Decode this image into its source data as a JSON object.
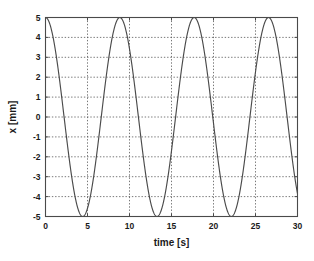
{
  "chart_data": {
    "type": "line",
    "title": "",
    "xlabel": "time [s]",
    "ylabel": "x [mm]",
    "xlim": [
      0,
      30
    ],
    "ylim": [
      -5,
      5
    ],
    "xticks": [
      0,
      5,
      10,
      15,
      20,
      25,
      30
    ],
    "xtick_labels": [
      "0",
      "5",
      "10",
      "15",
      "20",
      "25",
      "30"
    ],
    "yticks": [
      5,
      4,
      3,
      2,
      1,
      0,
      -1,
      -2,
      -3,
      -4,
      -5
    ],
    "ytick_labels": [
      "5",
      "4",
      "3",
      "2",
      "1",
      "0",
      "-1",
      "-2",
      "-3",
      "-4",
      "-5"
    ],
    "grid": true,
    "grid_style": "dotted",
    "legend": null,
    "series": [
      {
        "name": "x(t)",
        "amplitude": 5,
        "period": 8.85,
        "phase_deg": 0,
        "waveform": "cosine",
        "color": "#4b4b4b",
        "x": [
          0.0,
          0.3,
          0.6,
          0.9,
          1.2,
          1.5,
          1.8,
          2.1,
          2.4,
          2.7,
          3.0,
          3.3,
          3.6,
          3.9,
          4.2,
          4.425,
          4.65,
          4.95,
          5.25,
          5.55,
          5.85,
          6.15,
          6.45,
          6.75,
          7.05,
          7.35,
          7.65,
          7.95,
          8.25,
          8.55,
          8.85,
          9.15,
          9.45,
          9.75,
          10.05,
          10.35,
          10.65,
          10.95,
          11.25,
          11.55,
          11.85,
          12.15,
          12.45,
          12.75,
          13.05,
          13.275,
          13.5,
          13.8,
          14.1,
          14.4,
          14.7,
          15.0,
          15.3,
          15.6,
          15.9,
          16.2,
          16.5,
          16.8,
          17.1,
          17.4,
          17.7,
          18.0,
          18.3,
          18.6,
          18.9,
          19.2,
          19.5,
          19.8,
          20.1,
          20.4,
          20.7,
          21.0,
          21.3,
          21.6,
          21.9,
          22.125,
          22.35,
          22.65,
          22.95,
          23.25,
          23.55,
          23.85,
          24.15,
          24.45,
          24.75,
          25.05,
          25.35,
          25.65,
          25.95,
          26.25,
          26.55,
          26.85,
          27.15,
          27.45,
          27.75,
          28.05,
          28.35,
          28.65,
          28.95,
          29.25,
          29.55,
          29.85,
          30.0
        ],
        "y": [
          5.0,
          4.88,
          4.52,
          3.94,
          3.18,
          2.27,
          1.26,
          0.21,
          -0.84,
          -1.84,
          -2.75,
          -3.54,
          -4.17,
          -4.63,
          -4.91,
          -5.0,
          -4.91,
          -4.63,
          -4.17,
          -3.54,
          -2.75,
          -1.84,
          -0.84,
          0.21,
          1.26,
          2.27,
          3.18,
          3.94,
          4.52,
          4.88,
          5.0,
          4.88,
          4.52,
          3.94,
          3.18,
          2.27,
          1.26,
          0.21,
          -0.84,
          -1.84,
          -2.75,
          -3.54,
          -4.17,
          -4.63,
          -4.91,
          -5.0,
          -4.91,
          -4.63,
          -4.17,
          -3.54,
          -2.75,
          -1.84,
          -0.84,
          0.21,
          1.26,
          2.27,
          3.18,
          3.94,
          4.52,
          4.88,
          5.0,
          4.88,
          4.52,
          3.94,
          3.18,
          2.27,
          1.26,
          0.21,
          -0.84,
          -1.84,
          -2.75,
          -3.54,
          -4.17,
          -4.63,
          -4.91,
          -5.0,
          -4.91,
          -4.63,
          -4.17,
          -3.54,
          -2.75,
          -1.84,
          -0.84,
          0.21,
          1.26,
          2.27,
          3.18,
          3.94,
          4.52,
          4.88,
          5.0,
          4.88,
          4.52,
          3.94,
          3.18,
          2.27,
          1.26,
          0.21,
          -0.84,
          -1.84,
          -2.75,
          -3.54,
          -3.4
        ]
      }
    ]
  }
}
